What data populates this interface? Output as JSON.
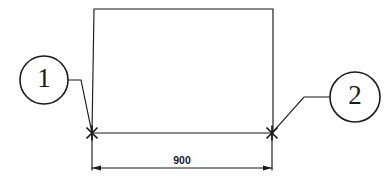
{
  "drawing": {
    "type": "cad-detail-callout-diagram",
    "background_color": "#ffffff",
    "line_color": "#1b1b1b",
    "callouts": [
      {
        "id": "callout-1",
        "label": "1",
        "circle": {
          "cx": 44,
          "cy": 80,
          "r": 24
        },
        "leader": "M 68 80 L 81 80 L 92 133"
      },
      {
        "id": "callout-2",
        "label": "2",
        "circle": {
          "cx": 355,
          "cy": 97,
          "r": 25
        },
        "leader": "M 330 97 L 304 97 L 272 133"
      }
    ],
    "body_outline": {
      "name": "rectangular-profile",
      "path": "M 94 9 L 273 9 L 273 133 M 94 9 L 92 133"
    },
    "base_line": {
      "x1": 92,
      "y1": 133,
      "x2": 272,
      "y2": 133
    },
    "node_marks": [
      {
        "name": "intersection-mark-left",
        "cx": 92,
        "cy": 133,
        "size": 11
      },
      {
        "name": "intersection-mark-right",
        "cx": 272,
        "cy": 133,
        "size": 11
      }
    ],
    "dimension": {
      "name": "overall-width-dimension",
      "value": "900",
      "text_x": 182,
      "text_y": 164,
      "line_y": 168,
      "x1": 92,
      "x2": 272,
      "extension_top_y": 136
    }
  }
}
